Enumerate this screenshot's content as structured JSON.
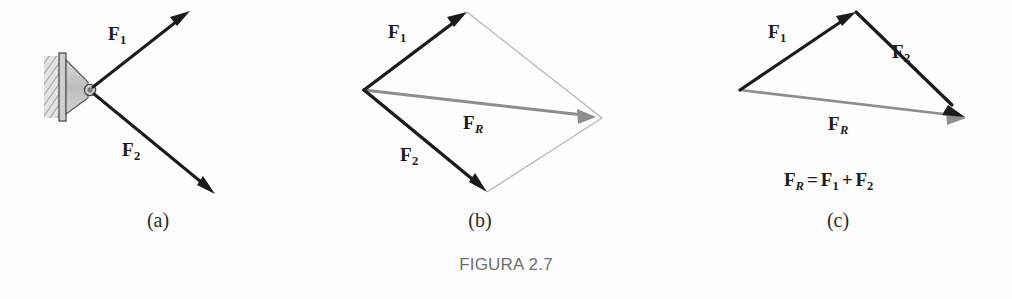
{
  "figure": {
    "title": "FIGURA 2.7",
    "title_color": "#6e6e6e",
    "background": "#fdfdfd"
  },
  "colors": {
    "force_vector": "#1b1b1b",
    "resultant_vector": "#8d8d8d",
    "construction_line": "#b4b4b4",
    "bracket_fill": "#c9c9c9",
    "bracket_edge": "#5a5a5a",
    "wall_hatch": "#9a9a9a"
  },
  "panels": [
    {
      "id": "a",
      "caption": "(a)",
      "description": "two forces applied to a bracket pin",
      "labels": [
        {
          "name": "f1",
          "base": "F",
          "sub": "1",
          "sub_italic": false
        },
        {
          "name": "f2",
          "base": "F",
          "sub": "2",
          "sub_italic": false
        }
      ]
    },
    {
      "id": "b",
      "caption": "(b)",
      "description": "parallelogram law construction",
      "labels": [
        {
          "name": "f1",
          "base": "F",
          "sub": "1",
          "sub_italic": false
        },
        {
          "name": "f2",
          "base": "F",
          "sub": "2",
          "sub_italic": false
        },
        {
          "name": "fr",
          "base": "F",
          "sub": "R",
          "sub_italic": true
        }
      ]
    },
    {
      "id": "c",
      "caption": "(c)",
      "description": "triangle rule construction",
      "labels": [
        {
          "name": "f1",
          "base": "F",
          "sub": "1",
          "sub_italic": false
        },
        {
          "name": "f2",
          "base": "F",
          "sub": "2",
          "sub_italic": false
        },
        {
          "name": "fr",
          "base": "F",
          "sub": "R",
          "sub_italic": true
        }
      ],
      "equation": {
        "lhs_base": "F",
        "lhs_sub": "R",
        "equals": "=",
        "term1_base": "F",
        "term1_sub": "1",
        "plus": "+",
        "term2_base": "F",
        "term2_sub": "2"
      }
    }
  ]
}
